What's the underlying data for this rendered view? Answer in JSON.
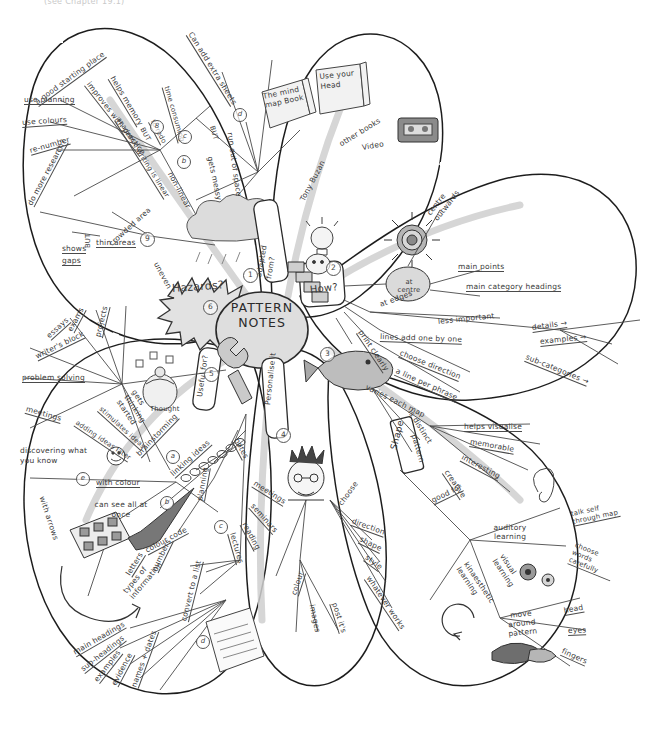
{
  "page": {
    "header_note": "(see Chapter 19.1)",
    "center_title": "PATTERN NOTES"
  },
  "branches": {
    "hazards": {
      "label": "Hazards?",
      "number": "6",
      "items": [
        {
          "text": "a good starting place",
          "id": "a-good-starting-place"
        },
        {
          "text": "use planning",
          "id": "use-planning"
        },
        {
          "text": "use colours",
          "id": "use-colours"
        },
        {
          "text": "re-number",
          "id": "re-number"
        },
        {
          "text": "do more research?",
          "id": "do-more-research"
        },
        {
          "text": "shows",
          "id": "shows"
        },
        {
          "text": "gaps",
          "id": "gaps"
        },
        {
          "text": "BUT",
          "id": "but-thin"
        },
        {
          "text": "thin areas",
          "id": "thin-areas"
        },
        {
          "text": "crowded area",
          "id": "crowded-area"
        },
        {
          "text": "uneven",
          "id": "uneven"
        },
        {
          "text": "helps memory",
          "id": "helps-memory"
        },
        {
          "text": "improves with practice",
          "id": "improves-with-practice"
        },
        {
          "text": "academic writing is linear",
          "id": "academic-writing-is-linear"
        },
        {
          "text": "non-linear",
          "id": "non-linear"
        },
        {
          "text": "Can add extra sheets",
          "id": "can-add-extra-sheets"
        },
        {
          "text": "time consuming",
          "id": "time-consuming"
        },
        {
          "text": "to redo",
          "id": "to-redo"
        },
        {
          "text": "BUT",
          "id": "but-redo"
        },
        {
          "text": "BUT",
          "id": "but-messy"
        },
        {
          "text": "gets messy",
          "id": "gets-messy"
        },
        {
          "text": "run out of space",
          "id": "run-out-of-space"
        }
      ],
      "numbers": [
        {
          "n": "9",
          "id": "num-9"
        },
        {
          "n": "8",
          "id": "num-8"
        },
        {
          "n": "7",
          "id": "num-7"
        },
        {
          "n": "b",
          "id": "ltr-b-hazard"
        },
        {
          "n": "c",
          "id": "ltr-c-hazard"
        },
        {
          "n": "d",
          "id": "ltr-d-hazard"
        }
      ]
    },
    "adapted_from": {
      "label": "adapted from?",
      "number": "1",
      "items": [
        {
          "text": "The mind map Book",
          "id": "the-mind-map-book"
        },
        {
          "text": "Use your Head",
          "id": "use-your-head"
        },
        {
          "text": "other books",
          "id": "other-books"
        },
        {
          "text": "Video",
          "id": "video"
        },
        {
          "text": "Tony Buzan",
          "id": "tony-buzan"
        }
      ]
    },
    "how": {
      "label": "How?",
      "number": "2",
      "items": [
        {
          "text": "centre outwards",
          "id": "centre-outwards"
        },
        {
          "text": "at centre",
          "id": "at-centre"
        },
        {
          "text": "at edges",
          "id": "at-edges"
        },
        {
          "text": "main points",
          "id": "main-points"
        },
        {
          "text": "main category headings",
          "id": "main-category-headings"
        },
        {
          "text": "less important",
          "id": "less-important"
        },
        {
          "text": "details →",
          "id": "details"
        },
        {
          "text": "examples →",
          "id": "examples-arrow"
        },
        {
          "text": "sub-categories →",
          "id": "sub-categories"
        },
        {
          "text": "lines add one by one",
          "id": "lines-add-one-by-one"
        },
        {
          "text": "choose direction",
          "id": "choose-direction-how"
        },
        {
          "text": "a line per phrase",
          "id": "a-line-per-phrase"
        },
        {
          "text": "print clearly",
          "id": "print-clearly"
        }
      ]
    },
    "shape": {
      "label": "Shape",
      "number": "3",
      "items": [
        {
          "text": "varies each map",
          "id": "varies-each-map"
        },
        {
          "text": "is distinct",
          "id": "is-distinct"
        },
        {
          "text": "pattern",
          "id": "pattern"
        },
        {
          "text": "helps visualise",
          "id": "helps-visualise"
        },
        {
          "text": "memorable",
          "id": "memorable"
        },
        {
          "text": "interesting",
          "id": "interesting"
        },
        {
          "text": "creative",
          "id": "creative"
        },
        {
          "text": "good for",
          "id": "good-for"
        },
        {
          "text": "auditory learning",
          "id": "auditory-learning"
        },
        {
          "text": "talk self through map",
          "id": "talk-self-through-map"
        },
        {
          "text": "choose words carefully",
          "id": "choose-words-carefully"
        },
        {
          "text": "kinaesthetic learning",
          "id": "kinaesthetic-learning"
        },
        {
          "text": "visual learning",
          "id": "visual-learning"
        },
        {
          "text": "move around pattern",
          "id": "move-around-pattern"
        },
        {
          "text": "head",
          "id": "head"
        },
        {
          "text": "eyes",
          "id": "eyes"
        },
        {
          "text": "fingers",
          "id": "fingers"
        }
      ]
    },
    "personalise": {
      "label": "Personalise it",
      "number": "4",
      "items": [
        {
          "text": "choose",
          "id": "choose"
        },
        {
          "text": "direction",
          "id": "direction"
        },
        {
          "text": "shape",
          "id": "shape-style"
        },
        {
          "text": "style",
          "id": "style"
        },
        {
          "text": "whatever works",
          "id": "whatever-works"
        },
        {
          "text": "colour",
          "id": "colour-personal"
        },
        {
          "text": "images",
          "id": "images"
        },
        {
          "text": "post it's",
          "id": "post-its"
        }
      ]
    },
    "useful_for": {
      "label": "Useful for?",
      "number": "5",
      "items": [
        {
          "text": "essays",
          "id": "essays"
        },
        {
          "text": "exams",
          "id": "exams"
        },
        {
          "text": "projects",
          "id": "projects"
        },
        {
          "text": "writer's block",
          "id": "writers-block"
        },
        {
          "text": "problem solving",
          "id": "problem-solving"
        },
        {
          "text": "meetings",
          "id": "meetings-left"
        },
        {
          "text": "gets thinking started",
          "id": "gets-thinking-started"
        },
        {
          "text": "stimulates ideas",
          "id": "stimulates-ideas"
        },
        {
          "text": "adding ideas later",
          "id": "adding-ideas-later"
        },
        {
          "text": "discovering what you know",
          "id": "discovering-what-you-know"
        },
        {
          "text": "brainstorming",
          "id": "brainstorming"
        },
        {
          "text": "linking ideas",
          "id": "linking-ideas"
        },
        {
          "text": "with colour",
          "id": "with-colour"
        },
        {
          "text": "can see all at once",
          "id": "can-see-all-at-once"
        },
        {
          "text": "with arrows",
          "id": "with-arrows"
        },
        {
          "text": "planning",
          "id": "planning"
        },
        {
          "text": "colour code",
          "id": "colour-code"
        },
        {
          "text": "letters",
          "id": "letters"
        },
        {
          "text": "numbers",
          "id": "numbers"
        },
        {
          "text": "convert to a list",
          "id": "convert-to-a-list"
        },
        {
          "text": "types of information",
          "id": "types-of-information"
        },
        {
          "text": "main headings",
          "id": "main-headings"
        },
        {
          "text": "sub-headings",
          "id": "sub-headings"
        },
        {
          "text": "examples",
          "id": "examples-left"
        },
        {
          "text": "evidence",
          "id": "evidence"
        },
        {
          "text": "names + dates",
          "id": "names-dates"
        },
        {
          "text": "notes",
          "id": "notes"
        },
        {
          "text": "meetings",
          "id": "meetings-centre"
        },
        {
          "text": "seminars",
          "id": "seminars"
        },
        {
          "text": "reading",
          "id": "reading"
        },
        {
          "text": "lectures",
          "id": "lectures"
        }
      ],
      "letters": [
        {
          "n": "a",
          "id": "ltr-a"
        },
        {
          "n": "b",
          "id": "ltr-b"
        },
        {
          "n": "c",
          "id": "ltr-c"
        },
        {
          "n": "d",
          "id": "ltr-d"
        },
        {
          "n": "e",
          "id": "ltr-e"
        },
        {
          "n": "f",
          "id": "ltr-f"
        }
      ]
    },
    "icons": [
      {
        "name": "thought-egg-icon",
        "caption": "Thought"
      },
      {
        "name": "spanner-icon",
        "caption": ""
      },
      {
        "name": "paint-palette-brush-icon",
        "caption": ""
      },
      {
        "name": "document-list-icon",
        "caption": ""
      },
      {
        "name": "open-book-icon",
        "caption": ""
      },
      {
        "name": "video-cassette-icon",
        "caption": ""
      },
      {
        "name": "lightbulb-head-icon",
        "caption": ""
      },
      {
        "name": "face-profile-icon",
        "caption": ""
      },
      {
        "name": "target-rings-icon",
        "caption": ""
      },
      {
        "name": "fish-icon",
        "caption": ""
      },
      {
        "name": "punk-head-icon",
        "caption": ""
      },
      {
        "name": "ear-icon",
        "caption": ""
      },
      {
        "name": "eye-icon",
        "caption": ""
      },
      {
        "name": "hand-pointing-icon",
        "caption": ""
      },
      {
        "name": "storm-cloud-icon",
        "caption": ""
      },
      {
        "name": "explosion-star-icon",
        "caption": ""
      },
      {
        "name": "stairs-icon",
        "caption": ""
      },
      {
        "name": "smiley-face-icon",
        "caption": ""
      },
      {
        "name": "arrow-loop-icon",
        "caption": ""
      },
      {
        "name": "chain-links-icon",
        "caption": ""
      }
    ]
  },
  "colors": {
    "ink": "#3a3a3a",
    "paper": "#ffffff",
    "pencil_shade": "#b9b9b9",
    "petal_outline": "#1f1f1f"
  }
}
